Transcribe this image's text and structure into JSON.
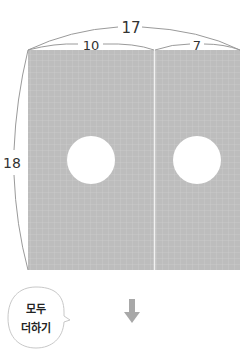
{
  "diagram": {
    "total_width_label": "17",
    "left_width_label": "10",
    "right_width_label": "7",
    "height_label": "18",
    "colors": {
      "panel_fill": "#bdbdbd",
      "grid_line": "#d4d4d4",
      "divider": "#f2f2f2",
      "hole": "#ffffff",
      "bracket": "#9a9a9a",
      "arrow": "#a8a8a8"
    }
  },
  "speech_bubble": {
    "line1": "모두",
    "line2": "더하기"
  },
  "arrow": {
    "icon": "arrow-down-icon"
  }
}
